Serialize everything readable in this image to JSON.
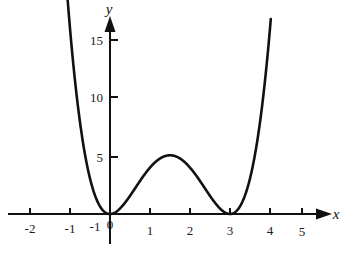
{
  "chart_data": {
    "type": "line",
    "title": "",
    "subtitle": "",
    "xlabel": "x",
    "ylabel": "y",
    "xlim": [
      -2.75,
      5.75
    ],
    "ylim": [
      -1.2,
      16.5
    ],
    "grid": false,
    "legend": null,
    "function": "y = x^2 (x - 3)^2",
    "x_ticks": [
      -2,
      -1,
      0,
      1,
      2,
      3,
      4,
      5
    ],
    "x_tick_labels": [
      "-2",
      "-1",
      "0",
      "1",
      "2",
      "3",
      "4",
      "5"
    ],
    "y_ticks": [
      5,
      10,
      15
    ],
    "y_tick_labels": [
      "5",
      "10",
      "15"
    ],
    "stray_label": "-1",
    "roots": [
      0,
      3
    ],
    "local_maximum": {
      "x": 1.5,
      "y": 5
    },
    "local_minima": [
      {
        "x": 0,
        "y": 0
      },
      {
        "x": 3,
        "y": 0
      }
    ],
    "series": [
      {
        "name": "y = x^2(x-3)^2",
        "color": "#111111",
        "x": [
          -1.06,
          -1.0,
          -0.95,
          -0.9,
          -0.85,
          -0.8,
          -0.75,
          -0.7,
          -0.65,
          -0.6,
          -0.55,
          -0.5,
          -0.45,
          -0.4,
          -0.35,
          -0.3,
          -0.25,
          -0.2,
          -0.15,
          -0.1,
          -0.05,
          0.0,
          0.1,
          0.2,
          0.3,
          0.4,
          0.5,
          0.6,
          0.7,
          0.8,
          0.9,
          1.0,
          1.1,
          1.2,
          1.3,
          1.4,
          1.5,
          1.6,
          1.7,
          1.8,
          1.9,
          2.0,
          2.1,
          2.2,
          2.3,
          2.4,
          2.5,
          2.6,
          2.7,
          2.8,
          2.9,
          3.0,
          3.05,
          3.1,
          3.15,
          3.2,
          3.25,
          3.3,
          3.35,
          3.4,
          3.45,
          3.5,
          3.55,
          3.6,
          3.65,
          3.7,
          3.75,
          3.8,
          3.85,
          3.9,
          3.95,
          4.0,
          4.02
        ],
        "y": [
          17.01,
          16.0,
          15.04,
          14.14,
          13.27,
          14.44,
          12.64,
          11.07,
          9.68,
          8.42,
          7.29,
          6.13,
          5.26,
          4.47,
          3.77,
          3.15,
          2.6,
          2.12,
          1.71,
          1.35,
          1.05,
          0.0,
          0.84,
          1.57,
          2.19,
          2.71,
          3.13,
          3.46,
          3.71,
          3.88,
          3.99,
          4.0,
          4.0,
          3.92,
          3.78,
          3.59,
          5.0,
          4.94,
          4.75,
          4.47,
          4.13,
          4.0,
          3.53,
          3.1,
          2.66,
          2.21,
          1.77,
          1.37,
          1.01,
          0.71,
          0.45,
          0.0,
          0.02,
          0.1,
          0.22,
          0.41,
          0.66,
          0.98,
          1.38,
          1.85,
          2.42,
          3.06,
          3.81,
          4.67,
          5.63,
          6.71,
          7.91,
          9.25,
          10.72,
          12.34,
          14.12,
          16.0,
          16.8
        ]
      }
    ]
  },
  "axes": {
    "x_axis_label": "x",
    "y_axis_label": "y",
    "origin_label": "0"
  }
}
